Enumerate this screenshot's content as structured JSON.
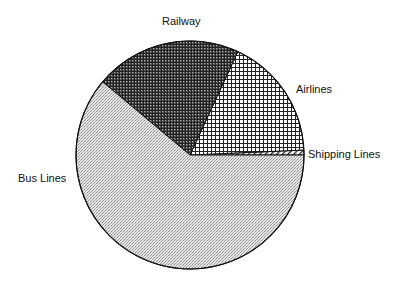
{
  "chart_data": {
    "type": "pie",
    "title": "",
    "categories": [
      "Shipping Lines",
      "Airlines",
      "Railway",
      "Bus Lines"
    ],
    "values": [
      0.7,
      17.4,
      20.8,
      61.1
    ],
    "unit": "percent (estimated from slice angles)",
    "start_angle_deg": 0,
    "direction": "counterclockwise",
    "legend": "none (direct labels)",
    "patterns": {
      "Shipping Lines": "diagonal hatch",
      "Airlines": "open crosshatch grid",
      "Railway": "dense dark crosshatch",
      "Bus Lines": "light fine dot stipple"
    },
    "labels": [
      {
        "text": "Railway",
        "x": 162,
        "y": 25
      },
      {
        "text": "Airlines",
        "x": 296,
        "y": 93
      },
      {
        "text": "Shipping Lines",
        "x": 308,
        "y": 158
      },
      {
        "text": "Bus Lines",
        "x": 18,
        "y": 182
      }
    ]
  },
  "colors": {
    "outline": "#111111",
    "background": "#ffffff"
  }
}
